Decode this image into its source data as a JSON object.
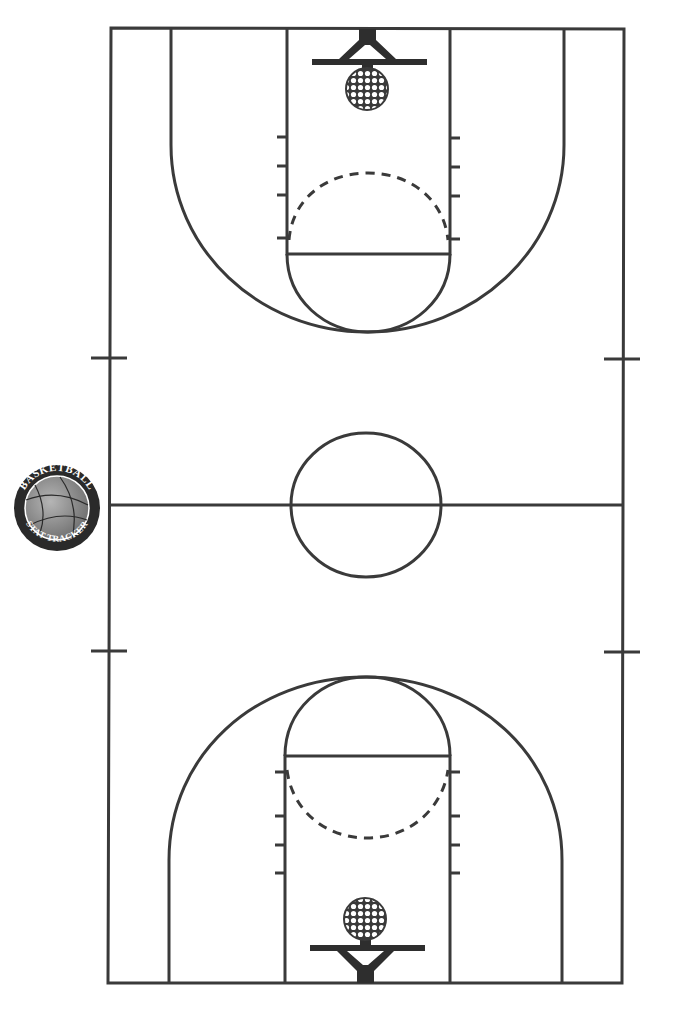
{
  "diagram": {
    "type": "basketball-court",
    "orientation": "vertical",
    "line_color": "#3a3a3a",
    "background": "#ffffff",
    "logo": {
      "top_text": "BASKETBALL",
      "bottom_text": "STAT TRACKER",
      "stars": "★ ★",
      "ring_color": "#2a2a2a",
      "ball_color": "#8c8c8c"
    }
  }
}
